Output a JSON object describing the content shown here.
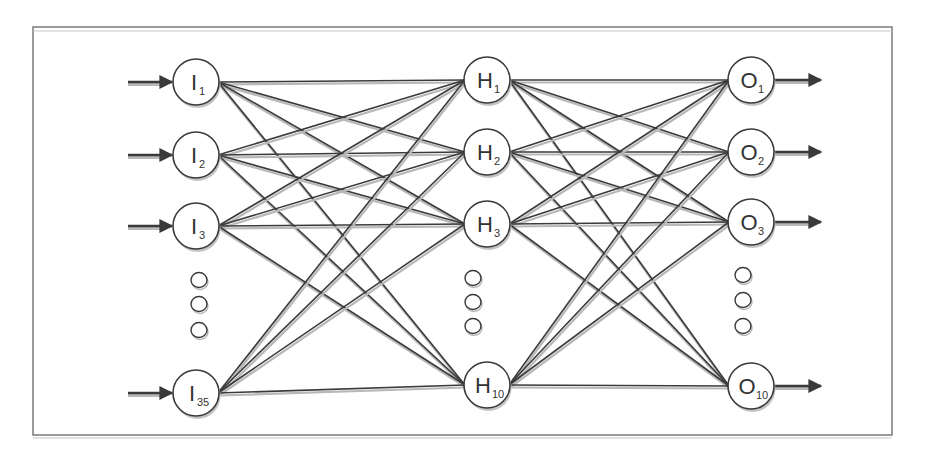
{
  "diagram": {
    "type": "feedforward-neural-network",
    "colors": {
      "frame": "#7a7a7a",
      "edge": "#3a3a3a",
      "edge_shadow": "#b8b8b8",
      "node_fill": "#ffffff",
      "node_stroke": "#3a3a3a",
      "text": "#333333"
    },
    "layers": [
      {
        "name": "input",
        "x": 196,
        "nodes": [
          {
            "letter": "I",
            "sub": "1",
            "y": 82
          },
          {
            "letter": "I",
            "sub": "2",
            "y": 155
          },
          {
            "letter": "I",
            "sub": "3",
            "y": 226
          },
          {
            "letter": "I",
            "sub": "35",
            "y": 393
          }
        ],
        "ellipsis_y": [
          280,
          304,
          330
        ],
        "ellipsis_x": 199
      },
      {
        "name": "hidden",
        "x": 487,
        "nodes": [
          {
            "letter": "H",
            "sub": "1",
            "y": 80
          },
          {
            "letter": "H",
            "sub": "2",
            "y": 152
          },
          {
            "letter": "H",
            "sub": "3",
            "y": 224
          },
          {
            "letter": "H",
            "sub": "10",
            "y": 385
          }
        ],
        "ellipsis_y": [
          278,
          302,
          326
        ],
        "ellipsis_x": 473
      },
      {
        "name": "output",
        "x": 751,
        "nodes": [
          {
            "letter": "O",
            "sub": "1",
            "y": 80
          },
          {
            "letter": "O",
            "sub": "2",
            "y": 152
          },
          {
            "letter": "O",
            "sub": "3",
            "y": 222
          },
          {
            "letter": "O",
            "sub": "10",
            "y": 386
          }
        ],
        "ellipsis_y": [
          275,
          300,
          326
        ],
        "ellipsis_x": 743
      }
    ],
    "node_radius": 23,
    "input_arrows": {
      "x_start": 128,
      "length": 46
    },
    "output_arrows": {
      "length": 46
    },
    "frame": {
      "x": 33,
      "y": 27,
      "width": 859,
      "height": 408
    }
  }
}
